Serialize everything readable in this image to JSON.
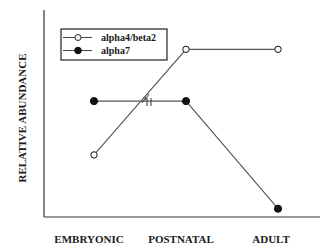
{
  "chart_data": {
    "type": "line",
    "title": "",
    "xlabel": "",
    "ylabel": "RELATIVE ABUNDANCE",
    "categories": [
      "EMBRYONIC",
      "POSTNATAL",
      "ADULT"
    ],
    "ylim": [
      0,
      1
    ],
    "grid": false,
    "legend_position": "upper-left (inside)",
    "y_ticks": "none (qualitative scale)",
    "series": [
      {
        "name": "alpha4/beta2",
        "marker": "open-circle",
        "values": [
          0.3,
          0.81,
          0.81
        ]
      },
      {
        "name": "alpha7",
        "marker": "filled-circle",
        "values": [
          0.56,
          0.56,
          0.04
        ]
      }
    ],
    "annotations": [
      "axis-break marks where lines cross between EMBRYONIC and POSTNATAL"
    ],
    "colors": {
      "line": "#555555",
      "marker": "#111111",
      "axis": "#333333"
    }
  },
  "legend": {
    "items": [
      {
        "label": "alpha4/beta2",
        "marker": "open-circle-icon"
      },
      {
        "label": "alpha7",
        "marker": "filled-circle-icon"
      }
    ]
  }
}
